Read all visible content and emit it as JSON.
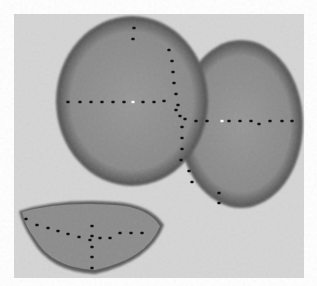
{
  "image": {
    "description": "Grayscale micrograph of two overlapping round discs and a half-disc fragment, each annotated with dotted measurement lines",
    "colors": {
      "page": "#ffffff",
      "field": "#d6d6d6",
      "disc_fill": "#8e8e8e",
      "disc_edge": "#5a5a5a",
      "dot": "#111111",
      "center_marker": "#ffffff"
    },
    "objects": [
      {
        "name": "left-disc",
        "shape": "circle",
        "annotation": "crosshair of dotted lines with white center marker"
      },
      {
        "name": "right-disc",
        "shape": "circle",
        "annotation": "dotted horizontal diameter with white center marker and vertical dotted line on overlap"
      },
      {
        "name": "bottom-fragment",
        "shape": "half-disc",
        "annotation": "dotted horizontal and vertical lines crossing"
      }
    ]
  }
}
